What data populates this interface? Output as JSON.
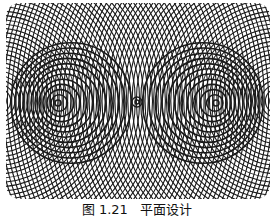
{
  "figure": {
    "colors": {
      "line": "#1a1a1a",
      "background": "#ffffff"
    },
    "frame": {
      "x": 2,
      "y": 2,
      "width": 264,
      "height": 196,
      "corner_radius": 14
    },
    "circle_families": [
      {
        "name": "left-outer",
        "cx": -6,
        "cy": 100,
        "r_start": 4,
        "r_step": 4.3,
        "count": 72,
        "stroke_width": 1.1
      },
      {
        "name": "right-outer",
        "cx": 274,
        "cy": 100,
        "r_start": 4,
        "r_step": 4.3,
        "count": 72,
        "stroke_width": 1.1
      },
      {
        "name": "left-eye",
        "cx": 54,
        "cy": 102,
        "r_start": 3,
        "r_step": 5.2,
        "count": 12,
        "stroke_width": 1.6,
        "offset_x": 1.2
      },
      {
        "name": "right-eye",
        "cx": 212,
        "cy": 102,
        "r_start": 3,
        "r_step": 5.2,
        "count": 12,
        "stroke_width": 1.6,
        "offset_x": -1.2
      },
      {
        "name": "center-dot",
        "cx": 133,
        "cy": 101,
        "r_start": 2,
        "r_step": 3,
        "count": 2,
        "stroke_width": 1.3
      }
    ]
  },
  "caption": {
    "label": "图 1.21",
    "title": "平面设计",
    "text": "图 1.21   平面设计"
  }
}
